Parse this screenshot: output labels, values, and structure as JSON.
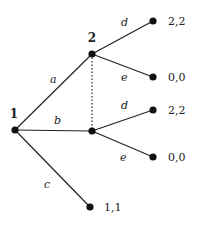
{
  "diagram": {
    "type": "extensive-form game tree",
    "players": [
      {
        "id": "n1",
        "label": "1",
        "x": 15,
        "y": 130,
        "label_x": 14,
        "label_y": 118
      },
      {
        "id": "n2",
        "label": "2",
        "x": 92,
        "y": 54,
        "label_x": 92,
        "label_y": 42
      }
    ],
    "info_set_nodes": [
      {
        "id": "n2",
        "x": 92,
        "y": 54
      },
      {
        "id": "n2b",
        "x": 92,
        "y": 131
      }
    ],
    "terminals": [
      {
        "id": "t1",
        "x": 153,
        "y": 21,
        "payoff": "2,2",
        "px": 168,
        "py": 25
      },
      {
        "id": "t2",
        "x": 153,
        "y": 77,
        "payoff": "0,0",
        "px": 168,
        "py": 81
      },
      {
        "id": "t3",
        "x": 153,
        "y": 110,
        "payoff": "2,2",
        "px": 168,
        "py": 114
      },
      {
        "id": "t4",
        "x": 153,
        "y": 157,
        "payoff": "0,0",
        "px": 168,
        "py": 161
      },
      {
        "id": "t5",
        "x": 90,
        "y": 207,
        "payoff": "1,1",
        "px": 104,
        "py": 211
      }
    ],
    "edges": [
      {
        "from": "n1",
        "to": "n2",
        "label": "a",
        "lx": 50,
        "ly": 83
      },
      {
        "from": "n1",
        "to": "n2b",
        "label": "b",
        "lx": 54,
        "ly": 124
      },
      {
        "from": "n1",
        "to": "t5",
        "label": "c",
        "lx": 44,
        "ly": 188
      },
      {
        "from": "n2",
        "to": "t1",
        "label": "d",
        "lx": 121,
        "ly": 26
      },
      {
        "from": "n2",
        "to": "t2",
        "label": "e",
        "lx": 121,
        "ly": 81
      },
      {
        "from": "n2b",
        "to": "t3",
        "label": "d",
        "lx": 121,
        "ly": 109
      },
      {
        "from": "n2b",
        "to": "t4",
        "label": "e",
        "lx": 120,
        "ly": 161
      }
    ]
  }
}
